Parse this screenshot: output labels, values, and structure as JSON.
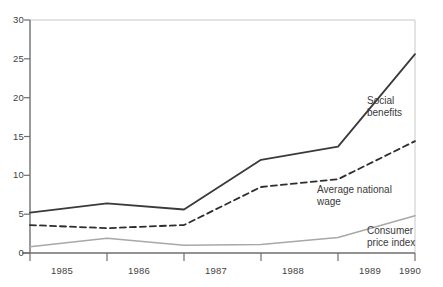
{
  "chart_data": {
    "type": "line",
    "title": "",
    "subtitle": "",
    "xlabel": "",
    "ylabel": "",
    "x": [
      "1985",
      "1986",
      "1987",
      "1988",
      "1989",
      "1990"
    ],
    "categories": [
      "1985",
      "1986",
      "1987",
      "1988",
      "1989",
      "1990"
    ],
    "xlim": [
      "1985",
      "1990"
    ],
    "ylim": [
      0,
      30
    ],
    "yticks": [
      0,
      5,
      10,
      15,
      20,
      25,
      30
    ],
    "ytick_labels": [
      "0",
      "5",
      "10",
      "15",
      "20",
      "25",
      "30"
    ],
    "xtick_labels": [
      "1985",
      "1986",
      "1987",
      "1988",
      "1989",
      "1990"
    ],
    "grid": false,
    "legend": "annotations-on-plot",
    "series": [
      {
        "name": "Social benefits",
        "label": "Social\nbenefits",
        "label_line1": "Social",
        "label_line2": "benefits",
        "style": "solid",
        "color": "#3a3a3a",
        "width": 1.8,
        "values": [
          5.2,
          6.4,
          5.6,
          12.0,
          13.7,
          25.6
        ]
      },
      {
        "name": "Average national wage",
        "label": "Average national\nwage",
        "label_line1": "Average national",
        "label_line2": "wage",
        "style": "dashed",
        "color": "#2e2e2e",
        "width": 1.8,
        "values": [
          3.6,
          3.2,
          3.6,
          8.5,
          9.5,
          14.4
        ]
      },
      {
        "name": "Consumer price index",
        "label": "Consumer\nprice index",
        "label_line1": "Consumer",
        "label_line2": "price index",
        "style": "solid",
        "color": "#a8a8a8",
        "width": 1.5,
        "values": [
          0.8,
          1.9,
          1.0,
          1.1,
          2.0,
          4.8
        ]
      }
    ],
    "axis_color": "#6f6f6f",
    "frame_top_color": "#c9c9c9",
    "frame_right_color": "#c9c9c9"
  }
}
